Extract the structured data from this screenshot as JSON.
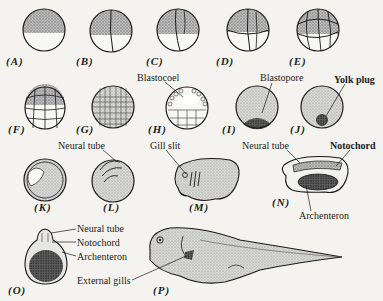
{
  "figure": {
    "stages": [
      {
        "id": "A",
        "label": "(A)"
      },
      {
        "id": "B",
        "label": "(B)"
      },
      {
        "id": "C",
        "label": "(C)"
      },
      {
        "id": "D",
        "label": "(D)"
      },
      {
        "id": "E",
        "label": "(E)"
      },
      {
        "id": "F",
        "label": "(F)"
      },
      {
        "id": "G",
        "label": "(G)"
      },
      {
        "id": "H",
        "label": "(H)"
      },
      {
        "id": "I",
        "label": "(I)"
      },
      {
        "id": "J",
        "label": "(J)"
      },
      {
        "id": "K",
        "label": "(K)"
      },
      {
        "id": "L",
        "label": "(L)"
      },
      {
        "id": "M",
        "label": "(M)"
      },
      {
        "id": "N",
        "label": "(N)"
      },
      {
        "id": "O",
        "label": "(O)"
      },
      {
        "id": "P",
        "label": "(P)"
      }
    ],
    "annotations": {
      "blastocoel": "Blastocoel",
      "blastopore": "Blastopore",
      "yolk_plug": "Yolk plug",
      "neural_tube_L": "Neural tube",
      "gill_slit": "Gill slit",
      "neural_tube_N": "Neural tube",
      "notochord_N": "Notochord",
      "archenteron_N": "Archenteron",
      "neural_tube_O": "Neural tube",
      "notochord_O": "Notochord",
      "archenteron_O": "Archenteron",
      "external_gills": "External gills"
    },
    "colors": {
      "background": "#f4f3ef",
      "ink": "#1a1a1a",
      "stipple_dark": "#8a8a8a",
      "stipple_light": "#cfcfcf",
      "yolk": "#f7f7f5"
    }
  }
}
